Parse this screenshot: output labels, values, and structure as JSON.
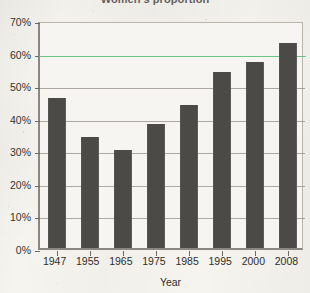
{
  "chart_data": {
    "type": "bar",
    "title": "Women's proportion",
    "xlabel": "Year",
    "ylabel": "",
    "categories": [
      "1947",
      "1955",
      "1965",
      "1975",
      "1985",
      "1995",
      "2000",
      "2008"
    ],
    "values": [
      46,
      34,
      30,
      38,
      44,
      54,
      57,
      63
    ],
    "value_labels": [
      "46%",
      "34%",
      "30%",
      "38%",
      "44%",
      "54%",
      "57%",
      "63%"
    ],
    "ylim": [
      0,
      70
    ],
    "ytick_labels": [
      "0%",
      "10%",
      "20%",
      "30%",
      "40%",
      "50%",
      "60%",
      "70%"
    ],
    "ytick_values": [
      0,
      10,
      20,
      30,
      40,
      50,
      60,
      70
    ],
    "grid": true,
    "legend": "none",
    "annotations": [
      {
        "name": "reference-line",
        "value": 60,
        "label": "",
        "color": "#63c888"
      }
    ],
    "colors": {
      "bar": "#4c4a46",
      "plot_background": "#f7f5f1",
      "page_background": "#f6f4ef",
      "axis": "#8a8780",
      "gridline": "#8d8a84",
      "reference_line": "#63c888",
      "text": "#2f2e2b"
    }
  }
}
